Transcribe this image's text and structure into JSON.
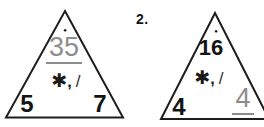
{
  "problem": {
    "number_label": "2."
  },
  "icons": {
    "apex_dot": "●"
  },
  "symbols": {
    "multiply": "✱",
    "separator": ",",
    "divide": "/"
  },
  "triangles": [
    {
      "top_value": "35",
      "bottom_left_value": "5",
      "bottom_right_value": "7",
      "answer_position": "top"
    },
    {
      "top_value": "16",
      "bottom_left_value": "4",
      "bottom_right_value": "4",
      "answer_position": "bottom-right"
    }
  ],
  "colors": {
    "ink": "#1d1d1d",
    "answer_gray": "#8d8d8d",
    "background": "#ffffff"
  }
}
